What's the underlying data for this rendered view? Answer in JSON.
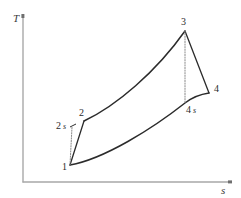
{
  "figure": {
    "background_color": "#ffffff",
    "line_color": "#2b2b2b",
    "axis_color": "#a8a8a8",
    "dotted_color": "#8a8a8a"
  },
  "axes": {
    "y_label": "T",
    "x_label": "s",
    "origin": [
      23,
      182
    ],
    "y_top": [
      23,
      15
    ],
    "x_right": [
      230,
      182
    ],
    "grid": false,
    "ticks": []
  },
  "chart_data": {
    "type": "line",
    "xlabel": "s",
    "ylabel": "T",
    "grid": false,
    "legend": "none",
    "xlim": [
      23,
      230
    ],
    "ylim": [
      182,
      15
    ],
    "state_points": [
      {
        "id": "1",
        "label": "1",
        "x": 70,
        "y": 165,
        "label_x": 62,
        "label_y": 170,
        "marker": false
      },
      {
        "id": "2s",
        "label": "2s",
        "x": 72,
        "y": 127,
        "label_x": 56,
        "label_y": 129,
        "marker": true
      },
      {
        "id": "2",
        "label": "2",
        "x": 84,
        "y": 121,
        "label_x": 79,
        "label_y": 116,
        "marker": false
      },
      {
        "id": "3",
        "label": "3",
        "x": 185,
        "y": 31,
        "label_x": 181,
        "label_y": 25,
        "marker": false
      },
      {
        "id": "4s",
        "label": "4s",
        "x": 185,
        "y": 103,
        "label_x": 186,
        "label_y": 113,
        "marker": false
      },
      {
        "id": "4",
        "label": "4",
        "x": 209,
        "y": 93,
        "label_x": 214,
        "label_y": 92,
        "marker": false
      }
    ],
    "series": [
      {
        "name": "compression-actual-1-2",
        "style": "solid",
        "path": "M 70 165 L 84 121"
      },
      {
        "name": "compression-isentropic-1-2s",
        "style": "dotted",
        "path": "M 70 165 L 72 127"
      },
      {
        "name": "heat-addition-2-3",
        "style": "solid-curve",
        "path": "M 84 121 C 116 106, 156 72, 185 31"
      },
      {
        "name": "expansion-actual-3-4",
        "style": "solid",
        "path": "M 185 31 L 209 93"
      },
      {
        "name": "expansion-isentropic-3-4s",
        "style": "dotted",
        "path": "M 185 31 L 185 103"
      },
      {
        "name": "heat-rejection-1-4s-4",
        "style": "solid-curve",
        "path": "M 70 165 C 104 159, 152 129, 185 103 C 194 96, 202 94, 209 93"
      }
    ],
    "annotations": [
      {
        "text": "T",
        "x": 13,
        "y": 22,
        "italic": true
      },
      {
        "text": "s",
        "x": 221,
        "y": 194,
        "italic": true
      }
    ]
  }
}
